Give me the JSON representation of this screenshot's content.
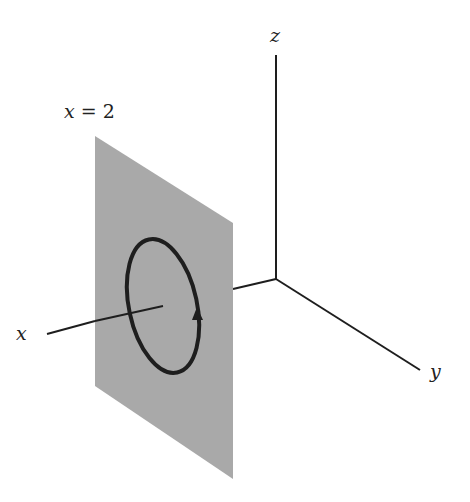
{
  "figure": {
    "axes": {
      "x": {
        "label": "x"
      },
      "y": {
        "label": "y"
      },
      "z": {
        "label": "z"
      }
    },
    "plane": {
      "label_var": "x",
      "label_eq": " = ",
      "label_value": "2",
      "fill_color": "#a9a9a9"
    },
    "curve": {
      "type": "ellipse",
      "orientation": "arrow pointing upward on right side",
      "stroke_color": "#1e1e1e"
    },
    "colors": {
      "axis": "#1e1e1e",
      "background": "#ffffff"
    }
  }
}
